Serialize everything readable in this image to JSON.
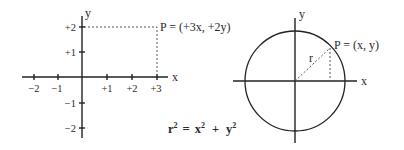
{
  "diagrams": {
    "cartesian": {
      "x_axis_label": "x",
      "y_axis_label": "y",
      "x_ticks": [
        "−2",
        "−1",
        "+1",
        "+2",
        "+3"
      ],
      "y_ticks": [
        "+2",
        "+1",
        "−1",
        "−2"
      ],
      "point_label": "P = (+3x, +2y)"
    },
    "circle": {
      "x_axis_label": "x",
      "y_axis_label": "y",
      "radius_label": "r",
      "point_label": "P = (x, y)"
    },
    "equation": {
      "lhs": "r",
      "lhs_exp": "2",
      "eq": "=",
      "term1": "x",
      "term1_exp": "2",
      "plus": "+",
      "term2": "y",
      "term2_exp": "2"
    }
  }
}
